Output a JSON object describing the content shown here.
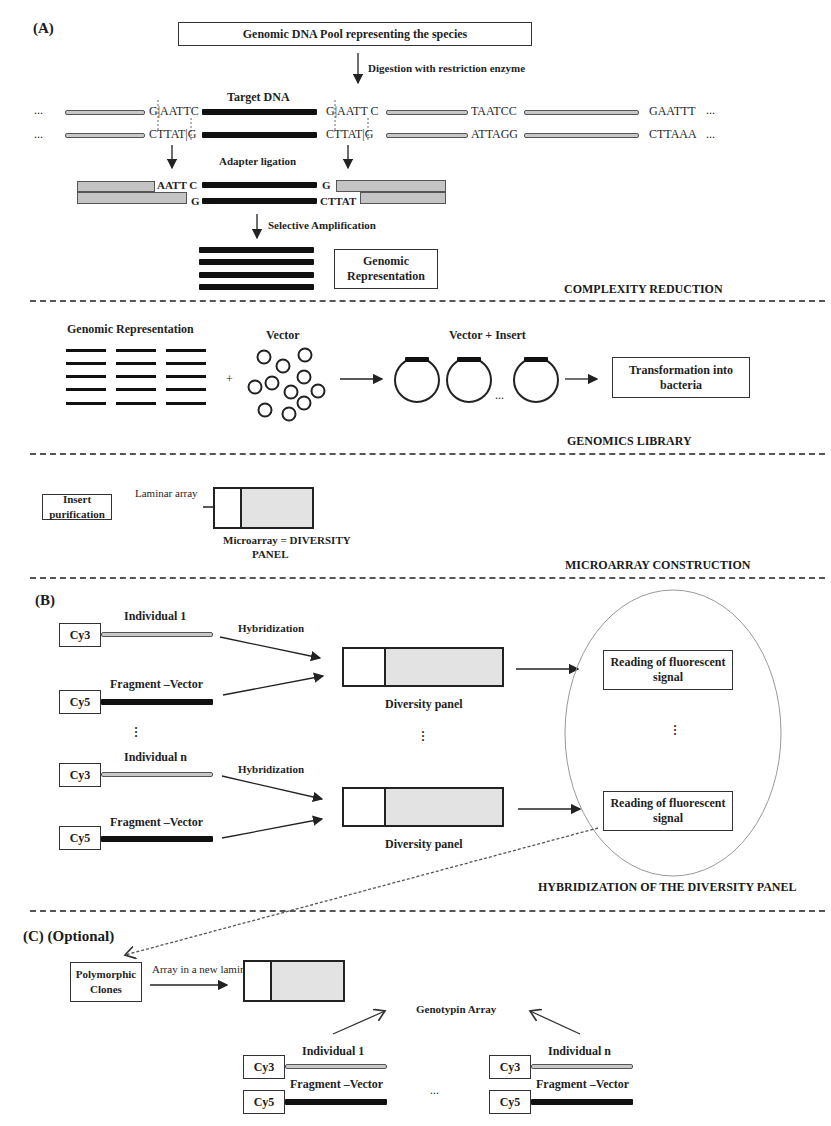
{
  "panels": {
    "a": {
      "tag": "(A)",
      "pool_box": "Genomic DNA Pool  representing the species",
      "digestion": "Digestion with restriction enzyme",
      "target_dna": "Target DNA",
      "ellipsis": "...",
      "seqs": {
        "top_left_site": "G|AATTC",
        "top_right_site": "G|AATT C",
        "top_taatcc": "TAATCC",
        "top_gaattt": "GAATTT",
        "bot_left_site": "CTTAT|G",
        "bot_right_site": "CTTAT|G",
        "bot_attagg": "ATTAGG",
        "bot_cttaaa": "CTTAAA"
      },
      "adapter_ligation": "Adapter ligation",
      "lig_seqs": {
        "aatt_c": "AATT C",
        "g_top": "G",
        "g_bottom": "G",
        "cttat": "CTTAT"
      },
      "selective_amplification": "Selective Amplification",
      "genomic_representation_box": "Genomic Representation",
      "section_title": "COMPLEXITY REDUCTION"
    },
    "library": {
      "genomic_representation": "Genomic Representation",
      "plus": "+",
      "vector": "Vector",
      "vector_insert": "Vector  + Insert",
      "ellipsis": "...",
      "transformation_box": "Transformation into bacteria",
      "section_title": "GENOMICS LIBRARY"
    },
    "microarray": {
      "insert_purification_box": "Insert purification",
      "laminar_array": "Laminar array",
      "array_caption_line1": "Microarray = DIVERSITY",
      "array_caption_line2": "PANEL",
      "section_title": "MICROARRAY CONSTRUCTION"
    },
    "b": {
      "tag": "(B)",
      "groups": [
        {
          "individual": "Individual 1",
          "fragment": "Fragment –Vector",
          "cy3": "Cy3",
          "cy5": "Cy5",
          "hybridization": "Hybridization",
          "panel_caption": "Diversity panel",
          "reading_box": "Reading of fluorescent signal"
        },
        {
          "individual": "Individual n",
          "fragment": "Fragment –Vector",
          "cy3": "Cy3",
          "cy5": "Cy5",
          "hybridization": "Hybridization",
          "panel_caption": "Diversity panel",
          "reading_box": "Reading of fluorescent signal"
        }
      ],
      "vdots": "⋮",
      "section_title": "HYBRIDIZATION OF THE DIVERSITY PANEL"
    },
    "c": {
      "tag": "(C)  (Optional)",
      "polymorphic_box": "Polymorphic Clones",
      "array_new_lamina": "Array in a new lamina",
      "genotyping_caption": "Genotypin Array",
      "left": {
        "individual": "Individual 1",
        "fragment": "Fragment –Vector",
        "cy3": "Cy3",
        "cy5": "Cy5"
      },
      "right": {
        "individual": "Individual n",
        "fragment": "Fragment –Vector",
        "cy3": "Cy3",
        "cy5": "Cy5"
      },
      "ellipsis": "..."
    }
  },
  "colors": {
    "strand_grey": "#c8c8c8",
    "strand_black": "#111111",
    "array_fill": "#e3e3e3",
    "divider": "#555555"
  }
}
